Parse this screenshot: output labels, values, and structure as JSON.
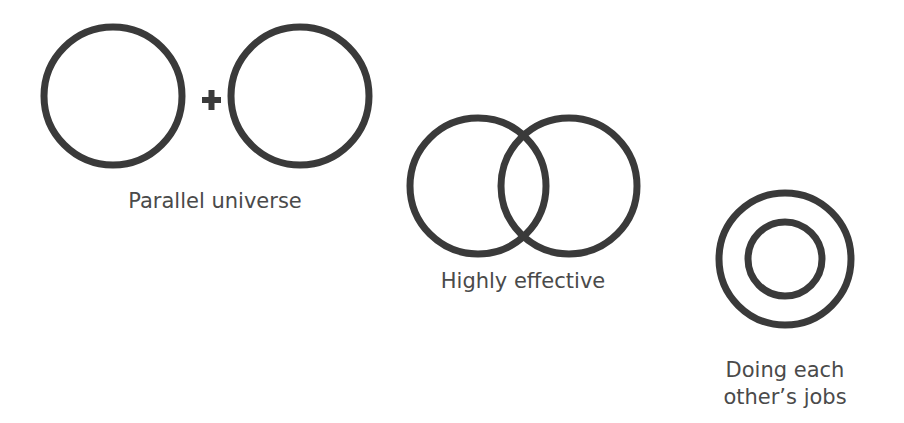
{
  "diagrams": [
    {
      "id": "parallel",
      "label": "Parallel universe",
      "relation": "separate",
      "connector": "+"
    },
    {
      "id": "effective",
      "label": "Highly effective",
      "relation": "overlapping"
    },
    {
      "id": "jobs",
      "label": "Doing each\nother’s jobs",
      "relation": "nested"
    }
  ]
}
